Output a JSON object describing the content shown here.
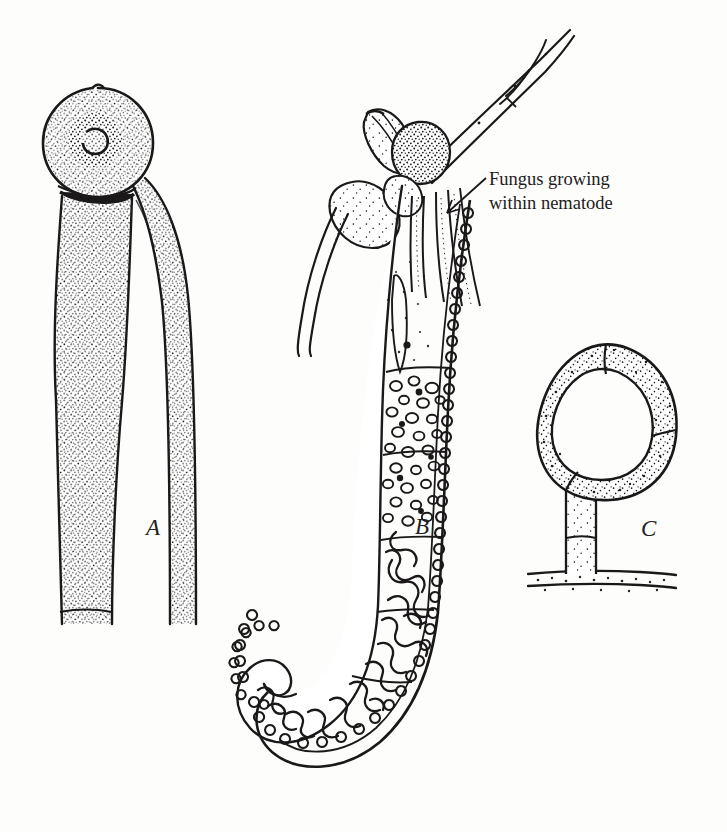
{
  "figure": {
    "kind": "scientific-line-illustration",
    "medium": "pen-and-ink stipple drawing",
    "background_color": "#fdfdfc",
    "ink_color": "#1a1818",
    "width": 727,
    "height": 832
  },
  "annotation": {
    "line1": "Fungus growing",
    "line2": "within nematode",
    "leader": "arrow pointing down-left into nematode body"
  },
  "panels": [
    {
      "id": "A",
      "label": "A",
      "label_x": 146,
      "label_y": 515,
      "description": "Stippled spherical conidium borne on a tapering conidiophore stalk, with a second adjacent stalk; septa near the base"
    },
    {
      "id": "B",
      "label": "B",
      "label_x": 415,
      "label_y": 514,
      "description": "Nematode with hooked tail, scalloped cuticle, body packed with fungal hyphae and vesicles; hyphae emerge at head and extend as a long branched hypha"
    },
    {
      "id": "C",
      "label": "C",
      "label_x": 641,
      "label_y": 516,
      "description": "Constricting ring trap of three stippled cells on a short stalk arising from a horizontal hypha"
    }
  ]
}
